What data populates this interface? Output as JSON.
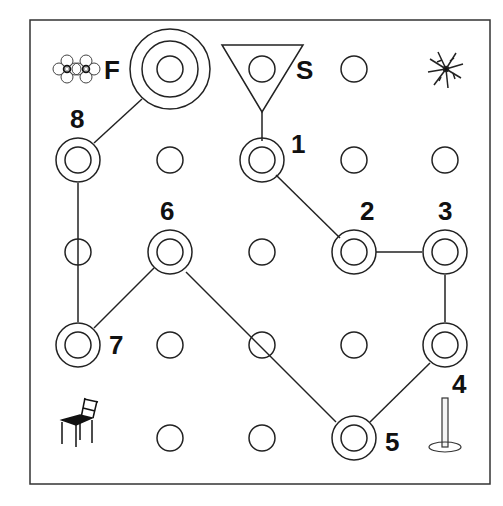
{
  "diagram": {
    "type": "grid-route-map",
    "grid": {
      "cols": 5,
      "rows": 5
    },
    "colors": {
      "stroke": "#222222",
      "background": "#ffffff",
      "text": "#111111"
    },
    "start": {
      "label": "S",
      "cell": [
        2,
        0
      ],
      "marker": "inverted-triangle"
    },
    "finish": {
      "label": "F",
      "cell": [
        1,
        0
      ],
      "marker": "triple-ring-target"
    },
    "waypoints": [
      {
        "label": "1",
        "cell": [
          2,
          1
        ]
      },
      {
        "label": "2",
        "cell": [
          3,
          2
        ]
      },
      {
        "label": "3",
        "cell": [
          4,
          2
        ]
      },
      {
        "label": "4",
        "cell": [
          4,
          3
        ]
      },
      {
        "label": "5",
        "cell": [
          3,
          4
        ]
      },
      {
        "label": "6",
        "cell": [
          1,
          2
        ]
      },
      {
        "label": "7",
        "cell": [
          0,
          3
        ]
      },
      {
        "label": "8",
        "cell": [
          0,
          1
        ]
      }
    ],
    "route": [
      "S",
      "1",
      "2",
      "3",
      "4",
      "5",
      "6",
      "7",
      "8",
      "F"
    ],
    "landmarks": [
      {
        "name": "flower-pattern",
        "cell": [
          0,
          0
        ]
      },
      {
        "name": "snowflake",
        "cell": [
          4,
          0
        ]
      },
      {
        "name": "chair",
        "cell": [
          0,
          4
        ]
      },
      {
        "name": "pin-stand",
        "cell": [
          4,
          4
        ]
      }
    ]
  }
}
